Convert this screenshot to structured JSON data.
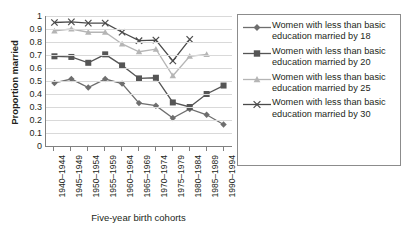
{
  "chart_data": {
    "type": "line",
    "title": "",
    "xlabel": "Five-year birth cohorts",
    "ylabel": "Proportion married",
    "ylim": [
      0,
      1
    ],
    "ytick_labels": [
      "1",
      "0.9",
      "0.8",
      "0.7",
      "0.6",
      "0.5",
      "0.4",
      "0.3",
      "0.2",
      "0.1",
      "0"
    ],
    "ytick_values": [
      1,
      0.9,
      0.8,
      0.7,
      0.6,
      0.5,
      0.4,
      0.3,
      0.2,
      0.1,
      0
    ],
    "grid": true,
    "legend_position": "right",
    "categories": [
      "1940–1944",
      "1945–1949",
      "1950–1954",
      "1955–1959",
      "1960–1964",
      "1965–1969",
      "1970–1974",
      "1975–1979",
      "1980–1984",
      "1985–1989",
      "1990–1994"
    ],
    "series": [
      {
        "name": "Women with less than basic education married by 18",
        "marker": "diamond",
        "color": "#6e6e6e",
        "values": [
          0.485,
          0.515,
          0.45,
          0.515,
          0.48,
          0.33,
          0.31,
          0.215,
          0.285,
          0.24,
          0.165
        ]
      },
      {
        "name": "Women with less than basic education married by 20",
        "marker": "square",
        "color": "#555555",
        "values": [
          0.69,
          0.685,
          0.64,
          0.705,
          0.62,
          0.52,
          0.525,
          0.335,
          0.3,
          0.4,
          0.465
        ]
      },
      {
        "name": "Women with less than basic education married by 25",
        "marker": "triangle",
        "color": "#b5b5b5",
        "values": [
          0.885,
          0.9,
          0.875,
          0.875,
          0.785,
          0.725,
          0.745,
          0.54,
          0.69,
          0.705,
          null
        ]
      },
      {
        "name": "Women with less than basic education married by 30",
        "marker": "x",
        "color": "#4a4a4a",
        "values": [
          0.95,
          0.955,
          0.945,
          0.945,
          0.875,
          0.81,
          0.815,
          0.655,
          0.82,
          null,
          null
        ]
      }
    ]
  },
  "legend": {
    "items": [
      {
        "label": "Women with less than basic education married by 18",
        "marker": "diamond-marker-icon"
      },
      {
        "label": "Women with less than basic education married by 20",
        "marker": "square-marker-icon"
      },
      {
        "label": "Women with less than basic education married by 25",
        "marker": "triangle-marker-icon"
      },
      {
        "label": "Women with less than basic education married by 30",
        "marker": "x-marker-icon"
      }
    ]
  }
}
